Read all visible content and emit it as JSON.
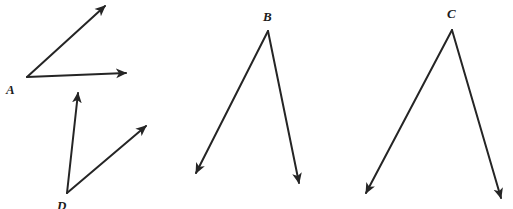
{
  "figure": {
    "type": "geometry-diagram",
    "width": 513,
    "height": 209,
    "background_color": "#ffffff",
    "stroke_color": "#252525",
    "stroke_width": 2,
    "label_color": "#1c1c1c",
    "angles": [
      {
        "id": "angle-a",
        "vertex_label": "A",
        "vertex": {
          "x": 27,
          "y": 77
        },
        "label_position": {
          "x": 6,
          "y": 83
        },
        "label_clipped": false,
        "rays": [
          {
            "id": "ray-a-upper",
            "from": {
              "x": 27,
              "y": 77
            },
            "to": {
              "x": 105,
              "y": 6
            },
            "arrowhead": "end",
            "direction": "up-right"
          },
          {
            "id": "ray-a-lower",
            "from": {
              "x": 27,
              "y": 77
            },
            "to": {
              "x": 126,
              "y": 73
            },
            "arrowhead": "end",
            "direction": "right"
          }
        ]
      },
      {
        "id": "angle-d",
        "vertex_label": "D",
        "vertex": {
          "x": 67,
          "y": 193
        },
        "label_position": {
          "x": 57,
          "y": 199
        },
        "label_clipped": true,
        "rays": [
          {
            "id": "ray-d-left",
            "from": {
              "x": 67,
              "y": 193
            },
            "to": {
              "x": 78,
              "y": 93
            },
            "arrowhead": "end",
            "direction": "up"
          },
          {
            "id": "ray-d-right",
            "from": {
              "x": 67,
              "y": 193
            },
            "to": {
              "x": 146,
              "y": 126
            },
            "arrowhead": "end",
            "direction": "up-right"
          }
        ]
      },
      {
        "id": "angle-b",
        "vertex_label": "B",
        "vertex": {
          "x": 268,
          "y": 31
        },
        "label_position": {
          "x": 263,
          "y": 10
        },
        "label_clipped": false,
        "rays": [
          {
            "id": "ray-b-left",
            "from": {
              "x": 268,
              "y": 31
            },
            "to": {
              "x": 196,
              "y": 173
            },
            "arrowhead": "end",
            "direction": "down-left"
          },
          {
            "id": "ray-b-right",
            "from": {
              "x": 268,
              "y": 31
            },
            "to": {
              "x": 299,
              "y": 183
            },
            "arrowhead": "end",
            "direction": "down-right"
          }
        ]
      },
      {
        "id": "angle-c",
        "vertex_label": "C",
        "vertex": {
          "x": 452,
          "y": 30
        },
        "label_position": {
          "x": 447,
          "y": 7
        },
        "label_clipped": false,
        "rays": [
          {
            "id": "ray-c-left",
            "from": {
              "x": 452,
              "y": 30
            },
            "to": {
              "x": 366,
              "y": 193
            },
            "arrowhead": "end",
            "direction": "down-left"
          },
          {
            "id": "ray-c-right",
            "from": {
              "x": 452,
              "y": 30
            },
            "to": {
              "x": 501,
              "y": 198
            },
            "arrowhead": "end",
            "direction": "down-right"
          }
        ]
      }
    ]
  }
}
